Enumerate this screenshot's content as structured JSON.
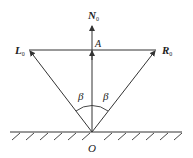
{
  "diagram": {
    "labels": {
      "N": {
        "text": "N",
        "sub": "0"
      },
      "A": {
        "text": "A"
      },
      "L": {
        "text": "L",
        "sub": "0"
      },
      "R": {
        "text": "R",
        "sub": "0"
      },
      "beta_left": {
        "text": "β"
      },
      "beta_right": {
        "text": "β"
      },
      "O": {
        "text": "O"
      }
    },
    "colors": {
      "stroke": "#333333",
      "background": "#ffffff"
    }
  }
}
